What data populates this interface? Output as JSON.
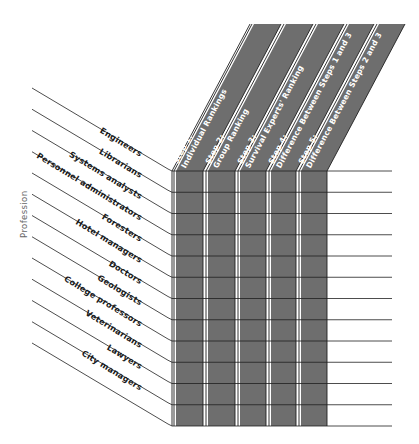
{
  "diagram": {
    "title_fragment": "",
    "axis_label": "Profession",
    "column_headers": [
      {
        "step": "Step 1:",
        "label": "Individual Rankings"
      },
      {
        "step": "Step 2:",
        "label": "Group Ranking"
      },
      {
        "step": "Step 3:",
        "label": "Survival Experts' Ranking"
      },
      {
        "step": "Step 4:",
        "label": "Difference Between Steps 1 and 3"
      },
      {
        "step": "Step 5:",
        "label": "Difference Between Steps 2 and 3"
      }
    ],
    "rows": [
      "Engineers",
      "Librarians",
      "Systems analysts",
      "Personnel administrators",
      "Foresters",
      "Hotel managers",
      "Doctors",
      "Geologists",
      "College professors",
      "Veterinarians",
      "Lawyers",
      "City managers"
    ],
    "colors": {
      "column_fill": "#6e6e6e",
      "line": "#1f1f1f",
      "row_label": "#1a1a1a",
      "header_text": "#ffffff",
      "axis_label": "#666666",
      "background": "#ffffff"
    }
  }
}
